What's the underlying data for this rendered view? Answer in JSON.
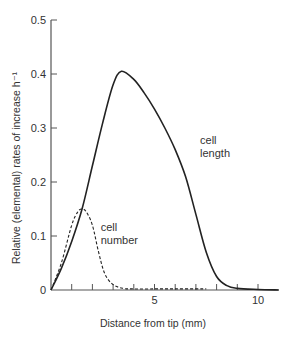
{
  "chart_data": {
    "type": "line",
    "title": "",
    "xlabel": "Distance from tip (mm)",
    "ylabel": "Relative (elemental) rates of increase h⁻¹",
    "xlim": [
      0,
      11
    ],
    "ylim": [
      0,
      0.5
    ],
    "x_ticks": [
      1,
      2,
      3,
      4,
      5,
      6,
      7,
      8,
      9,
      10
    ],
    "x_tick_labels": [
      {
        "value": 5,
        "label": "5"
      },
      {
        "value": 10,
        "label": "10"
      }
    ],
    "y_ticks": [
      0,
      0.1,
      0.2,
      0.3,
      0.4,
      0.5
    ],
    "y_tick_labels": [
      "0",
      "0.1",
      "0.2",
      "0.3",
      "0.4",
      "0.5"
    ],
    "grid": false,
    "legend": null,
    "series": [
      {
        "name": "cell length",
        "style": "solid",
        "x": [
          0,
          0.5,
          1.0,
          1.5,
          2.0,
          2.5,
          3.0,
          3.4,
          4.0,
          4.5,
          5.0,
          5.5,
          6.0,
          6.5,
          7.0,
          7.5,
          8.0,
          8.5,
          9.0,
          10.0,
          11.0
        ],
        "y": [
          0,
          0.04,
          0.09,
          0.15,
          0.23,
          0.31,
          0.38,
          0.405,
          0.39,
          0.365,
          0.335,
          0.3,
          0.26,
          0.21,
          0.14,
          0.07,
          0.025,
          0.008,
          0.003,
          0.001,
          0.0
        ]
      },
      {
        "name": "cell number",
        "style": "dashed",
        "x": [
          0,
          0.5,
          1.0,
          1.3,
          1.5,
          1.7,
          2.0,
          2.3,
          2.6,
          3.0,
          3.5,
          4.0,
          5.0,
          6.0,
          7.0,
          7.5
        ],
        "y": [
          0,
          0.05,
          0.12,
          0.145,
          0.15,
          0.145,
          0.12,
          0.07,
          0.03,
          0.01,
          0.003,
          0.002,
          0.002,
          0.002,
          0.002,
          0.002
        ]
      }
    ],
    "annotations": [
      {
        "text_lines": [
          "cell",
          "length"
        ],
        "x": 7.2,
        "y": 0.27
      },
      {
        "text_lines": [
          "cell",
          "number"
        ],
        "x": 2.4,
        "y": 0.11
      }
    ]
  }
}
